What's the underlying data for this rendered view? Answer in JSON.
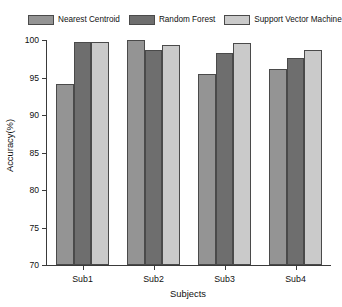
{
  "chart_data": {
    "type": "bar",
    "title": "",
    "subtitle": "",
    "xlabel": "Subjects",
    "ylabel": "Accuracy(%)",
    "categories": [
      "Sub1",
      "Sub2",
      "Sub3",
      "Sub4"
    ],
    "series": [
      {
        "name": "Nearest Centroid",
        "color": "#949494",
        "values": [
          94.2,
          100.0,
          95.5,
          96.1
        ]
      },
      {
        "name": "Random Forest",
        "color": "#6e6e6e",
        "values": [
          99.7,
          98.7,
          98.3,
          97.6
        ]
      },
      {
        "name": "Support Vector Machine",
        "color": "#cacaca",
        "values": [
          99.7,
          99.4,
          99.6,
          98.7
        ]
      }
    ],
    "ylim": [
      70,
      100
    ],
    "yticks": [
      70,
      75,
      80,
      85,
      90,
      95,
      100
    ],
    "ytick_labels": [
      "70",
      "75",
      "80",
      "85",
      "90",
      "95",
      "100"
    ],
    "grid": false,
    "legend_position": "top",
    "bar_edge_color": "#4a4a4a",
    "axis_color": "#3a3a3a",
    "background_color": "#ffffff"
  }
}
